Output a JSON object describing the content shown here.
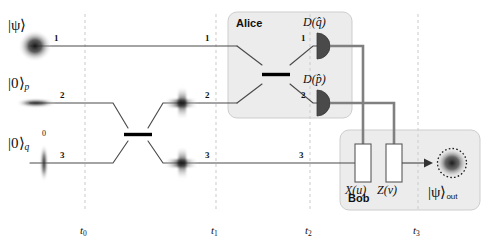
{
  "figure": {
    "type": "quantum-optics-circuit",
    "background": "#ffffff",
    "width": 490,
    "height": 251
  },
  "colors": {
    "rail": "#4a4a4a",
    "classical_wire": "#7a7a7a",
    "box_fill": "#ececec",
    "box_stroke": "#c9c9c9",
    "beamsplitter": "#000000",
    "detector": "#4a4a4a",
    "gate_fill": "#ffffff",
    "gate_stroke": "#5a5a5a",
    "timeline": "#cfcfcf",
    "text": "#111111"
  },
  "inputs": [
    {
      "id": "mode1",
      "ket": "|ψ⟩",
      "sub": "",
      "mode": "1",
      "wigner": "round-blob"
    },
    {
      "id": "mode2",
      "ket": "|0⟩",
      "sub": "p",
      "mode": "2",
      "wigner": "horizontal-squeezed"
    },
    {
      "id": "mode3",
      "ket": "|0⟩",
      "sub": "q",
      "mode": "3",
      "wigner": "vertical-squeezed",
      "extra_label": "0"
    }
  ],
  "mode_labels": {
    "before_t0": [
      "1",
      "2",
      "3"
    ],
    "at_t1": [
      "1",
      "2",
      "3"
    ],
    "alice_in": [
      "1",
      "2"
    ],
    "alice_out": [
      "1",
      "2"
    ],
    "at_t2_mode3": "3"
  },
  "timeline": {
    "ticks": [
      {
        "id": "t0",
        "label": "t",
        "sub": "0",
        "x": 85
      },
      {
        "id": "t1",
        "label": "t",
        "sub": "1",
        "x": 216
      },
      {
        "id": "t2",
        "label": "t",
        "sub": "2",
        "x": 310
      },
      {
        "id": "t3",
        "label": "t",
        "sub": "3",
        "x": 418
      }
    ]
  },
  "epr": {
    "name": "epr-beamsplitter",
    "note": "50:50 beam splitter entangling modes 2 and 3",
    "outputs": [
      "cross-star",
      "cross-star"
    ]
  },
  "alice": {
    "label": "Alice",
    "beamsplitter": "bell-measurement-beamsplitter",
    "detectors": [
      {
        "id": "dq",
        "label": "D(q̂)",
        "mode": "1"
      },
      {
        "id": "dp",
        "label": "D(p̂)",
        "mode": "2"
      }
    ]
  },
  "bob": {
    "label": "Bob",
    "gates": [
      {
        "id": "x",
        "label": "X(u)"
      },
      {
        "id": "z",
        "label": "Z(v)"
      }
    ],
    "output": {
      "ket": "|ψ⟩",
      "sub": "out",
      "wigner": "round-blob-dashed-circle"
    }
  },
  "classical_links": [
    {
      "from": "dq",
      "to": "x",
      "style": "feed-forward"
    },
    {
      "from": "dp",
      "to": "z",
      "style": "feed-forward"
    }
  ]
}
